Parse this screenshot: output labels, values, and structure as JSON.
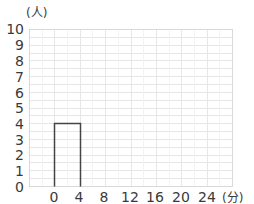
{
  "chart_data": {
    "type": "bar",
    "title": "",
    "xlabel": "(分)",
    "ylabel": "(人)",
    "x_ticks": [
      "0",
      "4",
      "8",
      "12",
      "16",
      "20",
      "24"
    ],
    "y_ticks": [
      "0",
      "1",
      "2",
      "3",
      "4",
      "5",
      "6",
      "7",
      "8",
      "9",
      "10"
    ],
    "ylim": [
      0,
      10
    ],
    "xlim": [
      -4,
      28
    ],
    "grid": true,
    "legend": null,
    "bins": [
      {
        "from": 0,
        "to": 4,
        "value": 4
      }
    ],
    "categories": [
      "0-4"
    ],
    "values": [
      4
    ]
  },
  "labels": {
    "y_unit": "(人)",
    "x_unit": "(分)",
    "y": [
      "10",
      "9",
      "8",
      "7",
      "6",
      "5",
      "4",
      "3",
      "2",
      "1",
      "0"
    ],
    "x": [
      "0",
      "4",
      "8",
      "12",
      "16",
      "20",
      "24"
    ]
  },
  "colors": {
    "grid": "#e6e6e6",
    "border": "#d9d9d9",
    "bar_stroke": "#444444",
    "text": "#3a3a3a"
  }
}
